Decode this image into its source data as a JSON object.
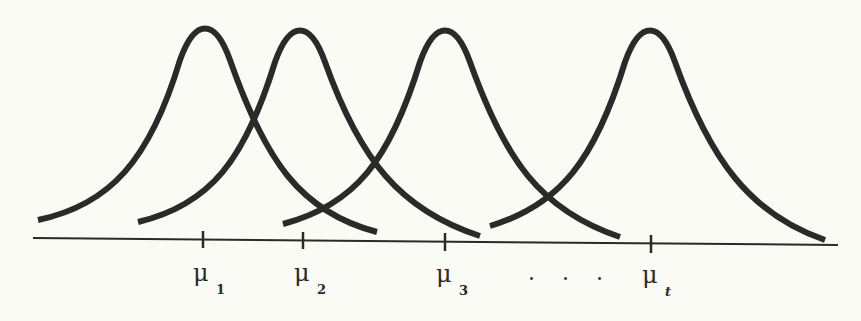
{
  "figure": {
    "colors": {
      "ink": "#2b2a28",
      "background": "#fbfbf6"
    },
    "means": [
      {
        "symbol": "μ",
        "subscript": "1",
        "x": 203
      },
      {
        "symbol": "μ",
        "subscript": "2",
        "x": 303
      },
      {
        "symbol": "μ",
        "subscript": "3",
        "x": 445
      },
      {
        "symbol": "μ",
        "subscript": "t",
        "x": 651
      }
    ],
    "ellipsis": ". . ."
  }
}
